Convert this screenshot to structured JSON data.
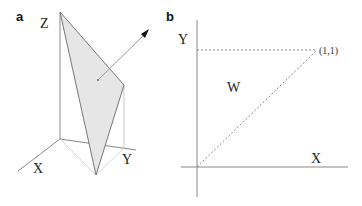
{
  "panel_a": {
    "label": "a",
    "axes": {
      "z": "Z",
      "x": "X",
      "y": "Y"
    },
    "plane_fill": "#e6e6e6",
    "plane_stroke": "#777777"
  },
  "panel_b": {
    "label": "b",
    "axes": {
      "y": "Y",
      "x": "X"
    },
    "region_label": "W",
    "point_label": "(1,1)"
  }
}
